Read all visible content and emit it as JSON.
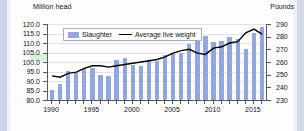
{
  "axis_titles": {
    "left": "Million head",
    "right": "Pounds"
  },
  "legend": {
    "bar_label": "Slaughter",
    "line_label": "Average live weight"
  },
  "colors": {
    "bar": "#93a6dd",
    "line": "#000000",
    "grid": "#dfe2e6",
    "axis": "#55585c"
  },
  "chart_data": {
    "type": "bar",
    "title": "",
    "xlabel": "",
    "ylabel": "Million head",
    "y2label": "Pounds",
    "ylim": [
      80.0,
      120.0
    ],
    "y2lim": [
      230,
      290
    ],
    "yticks": [
      "80.0",
      "85.0",
      "90.0",
      "95.0",
      "100.0",
      "105.0",
      "110.0",
      "115.0",
      "120.0"
    ],
    "y2ticks": [
      "230",
      "240",
      "250",
      "260",
      "270",
      "280",
      "290"
    ],
    "grid": true,
    "legend_position": "top-left",
    "x": [
      1990,
      1991,
      1992,
      1993,
      1994,
      1995,
      1996,
      1997,
      1998,
      1999,
      2000,
      2001,
      2002,
      2003,
      2004,
      2005,
      2006,
      2007,
      2008,
      2009,
      2010,
      2011,
      2012,
      2013,
      2014,
      2015,
      2016
    ],
    "xtick_labels": [
      "1990",
      "1995",
      "2000",
      "2005",
      "2010",
      "2015"
    ],
    "series": [
      {
        "name": "Slaughter",
        "type": "bar",
        "axis": "left",
        "unit": "Million head",
        "values": [
          85.1,
          88.5,
          95.3,
          94.2,
          96.2,
          96.8,
          93.0,
          92.5,
          101.3,
          102.2,
          98.3,
          98.0,
          100.3,
          100.7,
          103.9,
          104.0,
          104.5,
          109.6,
          116.8,
          113.6,
          110.5,
          110.9,
          113.2,
          112.1,
          106.9,
          115.4,
          118.6
        ]
      },
      {
        "name": "Average live weight",
        "type": "line",
        "axis": "right",
        "unit": "Pounds",
        "values": [
          249,
          248,
          251,
          252,
          255,
          257,
          257,
          256,
          257,
          258,
          259,
          260,
          261,
          262,
          264,
          267,
          269,
          270,
          267,
          266,
          271,
          272,
          275,
          276,
          283,
          286,
          282
        ]
      }
    ]
  }
}
